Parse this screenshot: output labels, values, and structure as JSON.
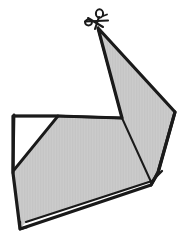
{
  "figure": {
    "title": "Cut shape with scissors",
    "canvas": {
      "width": 190,
      "height": 246,
      "background": "#ffffff"
    },
    "colors": {
      "ink": "#1a1a1a",
      "fill": "#c9c9c9",
      "fill_shade": "#d2d2d2",
      "notch": "#ffffff",
      "sliver": "#ffffff"
    },
    "stroke_widths": {
      "outline": 3.2,
      "interior": 1.9,
      "icon": 2.1
    },
    "icon": {
      "name": "scissors-icon",
      "label": "scissors",
      "anchor_x": 98,
      "anchor_y": 28
    },
    "points": {
      "apex": [
        98,
        28
      ],
      "right_vertex": [
        175,
        112
      ],
      "right_lower": [
        158,
        172
      ],
      "spike_foot_left": [
        122,
        118
      ],
      "top_left_corner": [
        14,
        116
      ],
      "notch_right": [
        58,
        116
      ],
      "notch_bottom": [
        14,
        170
      ],
      "left_kink": [
        13,
        172
      ],
      "bottom_left": [
        20,
        228
      ],
      "bottom_right": [
        152,
        184
      ]
    },
    "geometry": {
      "main_fill_path": "M 98 28 L 175 112 L 158 172 L 152 184 L 20 228 L 13 172 L 58 116 L 122 118 Z",
      "outer_outline_path": "M 98 28 L 175 112 L 158 173 L 151 185 L 20 229 L 13 173 L 13 116 L 58 116 L 122 118 L 98 28",
      "notch_path": "M 14 116 L 58 116 L 14 170 Z",
      "spike_left_edge_path": "M 98 29 L 122 118",
      "spike_right_edge_path": "M 98 29 L 175 112",
      "fold_line_path": "M 122 118 L 152 184",
      "top_edge_path": "M 14 116 L 58 116 L 122 118",
      "left_edge_path": "M 14 115 L 13 173",
      "sliver_upper_path": "M 26 222 L 152 181 L 162 171",
      "sliver_lower_path": "M 20 229 L 151 185 L 159 173",
      "bottom_tail_path": "M 20 222 L 20 229 L 27 227",
      "right_double_path": "M 175 112 L 158 172 L 151 185"
    }
  }
}
